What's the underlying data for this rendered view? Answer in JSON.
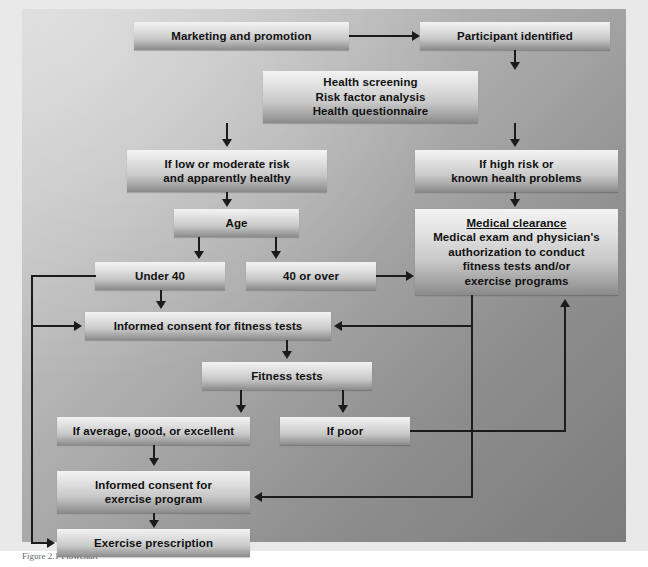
{
  "figure": {
    "type": "flowchart",
    "caption": "Figure 2.1  Flowchart",
    "background_colors": {
      "canvas_light": "#d4d4d4",
      "canvas_dark": "#7c7c7c",
      "box_light": "#f3f3f3",
      "box_dark": "#8a8a8a",
      "connector": "#1b1b1b",
      "text": "#111111"
    }
  },
  "nodes": {
    "marketing": {
      "label": "Marketing and promotion"
    },
    "participant": {
      "label": "Participant identified"
    },
    "screening": {
      "label": "Health screening\nRisk factor analysis\nHealth questionnaire"
    },
    "low_risk": {
      "label": "If low or moderate risk\nand apparently healthy"
    },
    "high_risk": {
      "label": "If high risk or\nknown health problems"
    },
    "age": {
      "label": "Age"
    },
    "medical_clearance": {
      "heading": "Medical clearance",
      "body": "Medical exam and physician's\nauthorization to conduct\nfitness tests and/or\nexercise programs"
    },
    "under40": {
      "label": "Under 40"
    },
    "over40": {
      "label": "40 or over"
    },
    "consent_fitness": {
      "label": "Informed consent for fitness tests"
    },
    "fitness_tests": {
      "label": "Fitness tests"
    },
    "result_good": {
      "label": "If average, good, or excellent"
    },
    "result_poor": {
      "label": "If poor"
    },
    "consent_exercise": {
      "label": "Informed consent for\nexercise program"
    },
    "prescription": {
      "label": "Exercise prescription"
    }
  },
  "edges": [
    {
      "from": "marketing",
      "to": "participant",
      "kind": "horizontal-arrow"
    },
    {
      "from": "participant",
      "to": "screening",
      "kind": "vertical-arrow"
    },
    {
      "from": "screening",
      "to": "low_risk",
      "kind": "vertical-arrow"
    },
    {
      "from": "screening",
      "to": "high_risk",
      "kind": "vertical-arrow"
    },
    {
      "from": "low_risk",
      "to": "age",
      "kind": "vertical-arrow"
    },
    {
      "from": "high_risk",
      "to": "medical_clearance",
      "kind": "vertical-arrow"
    },
    {
      "from": "age",
      "to": "under40",
      "kind": "vertical-arrow"
    },
    {
      "from": "age",
      "to": "over40",
      "kind": "vertical-arrow"
    },
    {
      "from": "over40",
      "to": "medical_clearance",
      "kind": "horizontal-arrow"
    },
    {
      "from": "under40",
      "to": "consent_fitness",
      "kind": "vertical-arrow"
    },
    {
      "from": "under40",
      "to": "prescription",
      "kind": "left-bypass"
    },
    {
      "from": "under40",
      "to": "consent_fitness",
      "kind": "left-bypass"
    },
    {
      "from": "medical_clearance",
      "to": "consent_fitness",
      "kind": "right-return"
    },
    {
      "from": "medical_clearance",
      "to": "consent_exercise",
      "kind": "right-return"
    },
    {
      "from": "consent_fitness",
      "to": "fitness_tests",
      "kind": "vertical-arrow"
    },
    {
      "from": "fitness_tests",
      "to": "result_good",
      "kind": "vertical-arrow"
    },
    {
      "from": "fitness_tests",
      "to": "result_poor",
      "kind": "vertical-arrow"
    },
    {
      "from": "result_poor",
      "to": "medical_clearance",
      "kind": "right-up-arrow"
    },
    {
      "from": "result_good",
      "to": "consent_exercise",
      "kind": "vertical-arrow"
    },
    {
      "from": "consent_exercise",
      "to": "prescription",
      "kind": "vertical-arrow"
    }
  ]
}
